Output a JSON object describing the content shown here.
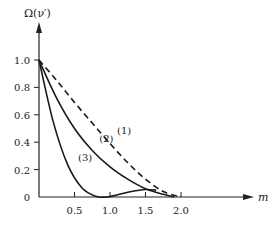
{
  "chart_data": {
    "type": "line",
    "title": "",
    "xlabel": "m",
    "ylabel": "Ω(ν′)",
    "xlim": [
      0,
      2.2
    ],
    "ylim": [
      0,
      1.15
    ],
    "grid": false,
    "legend": "inline labels",
    "x_ticks": [
      "0.5",
      "1.0",
      "1.5",
      "2.0"
    ],
    "y_ticks": [
      "0",
      "0.2",
      "0.4",
      "0.6",
      "0.8",
      "1.0"
    ],
    "series": [
      {
        "name": "(1)",
        "style": "dashed",
        "x": [
          0,
          0.25,
          0.5,
          0.75,
          1.0,
          1.25,
          1.5,
          1.75,
          2.0
        ],
        "y": [
          1.0,
          0.85,
          0.69,
          0.54,
          0.39,
          0.25,
          0.13,
          0.04,
          0.0
        ]
      },
      {
        "name": "(2)",
        "style": "solid",
        "x": [
          0,
          0.25,
          0.5,
          0.75,
          1.0,
          1.25,
          1.5,
          1.75,
          1.9
        ],
        "y": [
          1.0,
          0.72,
          0.5,
          0.34,
          0.22,
          0.13,
          0.06,
          0.02,
          0.0
        ]
      },
      {
        "name": "(3)",
        "style": "solid",
        "x": [
          0,
          0.2,
          0.4,
          0.6,
          0.8,
          0.95,
          1.1,
          1.3,
          1.5,
          1.65
        ],
        "y": [
          1.0,
          0.55,
          0.24,
          0.07,
          0.005,
          0.0,
          0.015,
          0.04,
          0.055,
          0.05
        ]
      }
    ],
    "annotations": [
      {
        "text": "(1)",
        "x": 1.1,
        "y": 0.46
      },
      {
        "text": "(2)",
        "x": 0.85,
        "y": 0.4
      },
      {
        "text": "(3)",
        "x": 0.55,
        "y": 0.26
      }
    ]
  },
  "axes": {
    "xlabel": "m",
    "ylabel": "Ω(ν′)"
  }
}
